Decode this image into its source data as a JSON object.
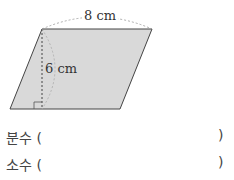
{
  "figure": {
    "shape": "parallelogram",
    "fill_color": "#d9d9d9",
    "base_label": "8 cm",
    "height_label": "6 cm"
  },
  "answers": [
    {
      "label": "분수 (",
      "close": ")"
    },
    {
      "label": "소수 (",
      "close": ")"
    }
  ]
}
